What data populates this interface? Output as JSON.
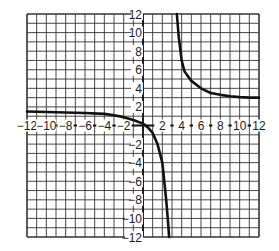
{
  "chart_data": {
    "type": "line",
    "title": "",
    "xlabel": "",
    "ylabel": "",
    "xlim": [
      -12,
      12
    ],
    "ylim": [
      -12,
      12
    ],
    "grid": true,
    "grid_step": 1,
    "x_tick_labels": [
      "-12",
      "-10",
      "-8",
      "-6",
      "-4",
      "-2",
      "2",
      "4",
      "6",
      "8",
      "10",
      "12"
    ],
    "y_tick_labels": [
      "12",
      "10",
      "8",
      "6",
      "4",
      "2",
      "-2",
      "-4",
      "-6",
      "-8",
      "-10",
      "-12"
    ],
    "series": [
      {
        "name": "left-branch",
        "x": [
          -12,
          -10,
          -8,
          -6,
          -4,
          -3,
          -2,
          -1,
          0,
          0.5,
          1,
          1.5,
          2,
          2.2,
          2.4,
          2.6,
          2.7
        ],
        "y": [
          1.5,
          1.45,
          1.4,
          1.35,
          1.25,
          1.1,
          0.9,
          0.6,
          0.2,
          -0.2,
          -0.8,
          -2,
          -4,
          -6,
          -8,
          -10.5,
          -12
        ]
      },
      {
        "name": "right-branch",
        "x": [
          3.5,
          3.7,
          4,
          4.3,
          5,
          6,
          7,
          8,
          9,
          10,
          11,
          12
        ],
        "y": [
          12,
          9.5,
          7,
          5.8,
          4.8,
          4,
          3.5,
          3.3,
          3.15,
          3.05,
          3,
          3
        ]
      }
    ],
    "asymptotes": {
      "vertical_x": 3,
      "horizontal_y_left": 1.5,
      "horizontal_y_right": 3
    }
  },
  "style": {
    "grid_color": "#333333",
    "axis_color": "#111111",
    "curve_color": "#111111",
    "background": "#ffffff"
  }
}
